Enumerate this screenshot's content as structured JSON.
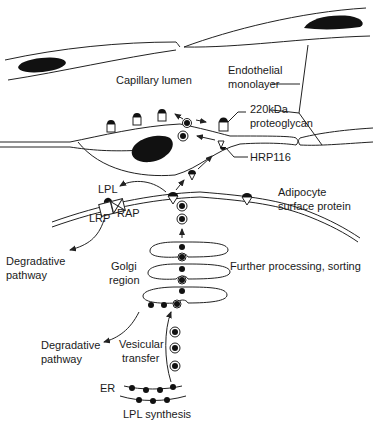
{
  "diagram": {
    "type": "biological-pathway",
    "labels": {
      "capillary_lumen": "Capillary lumen",
      "endothelial_line1": "Endothelial",
      "endothelial_line2": "monolayer",
      "proteoglycan_line1": "220kDa",
      "proteoglycan_line2": "proteoglycan",
      "hrp116": "HRP116",
      "lpl": "LPL",
      "lrp": "LRP",
      "rap": "RAP",
      "adipocyte_line1": "Adipocyte",
      "adipocyte_line2": "surface protein",
      "degradative1_line1": "Degradative",
      "degradative1_line2": "pathway",
      "golgi_line1": "Golgi",
      "golgi_line2": "region",
      "further_processing": "Further processing, sorting",
      "degradative2_line1": "Degradative",
      "degradative2_line2": "pathway",
      "vesicular_line1": "Vesicular",
      "vesicular_line2": "transfer",
      "er": "ER",
      "lpl_synthesis": "LPL synthesis"
    },
    "nodes": [
      {
        "id": "er",
        "label": "ER"
      },
      {
        "id": "golgi",
        "label": "Golgi region"
      },
      {
        "id": "adipocyte-membrane",
        "label": "Adipocyte surface protein"
      },
      {
        "id": "lrp-rap",
        "label": "LRP / RAP"
      },
      {
        "id": "hrp116",
        "label": "HRP116"
      },
      {
        "id": "proteoglycan",
        "label": "220kDa proteoglycan"
      },
      {
        "id": "endothelium",
        "label": "Endothelial monolayer"
      },
      {
        "id": "lumen",
        "label": "Capillary lumen"
      }
    ],
    "edges": [
      {
        "from": "er",
        "to": "golgi",
        "label": "Vesicular transfer"
      },
      {
        "from": "golgi",
        "to": "degradative-pathway",
        "label": "Degradative pathway"
      },
      {
        "from": "golgi",
        "to": "adipocyte-membrane",
        "label": "Further processing, sorting"
      },
      {
        "from": "adipocyte-membrane",
        "to": "lrp-rap",
        "label": "LPL"
      },
      {
        "from": "lrp-rap",
        "to": "degradative-pathway",
        "label": "Degradative pathway"
      },
      {
        "from": "adipocyte-membrane",
        "to": "hrp116",
        "label": ""
      },
      {
        "from": "hrp116",
        "to": "proteoglycan",
        "label": ""
      },
      {
        "from": "proteoglycan",
        "to": "lumen",
        "label": ""
      }
    ]
  }
}
